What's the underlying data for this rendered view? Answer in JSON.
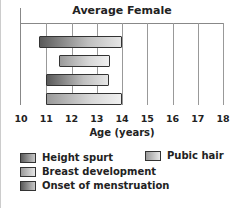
{
  "chart_data": {
    "type": "bar",
    "orientation": "horizontal-range",
    "title": "Average Female",
    "xlabel": "Age (years)",
    "ylabel": "",
    "xlim": [
      10,
      18
    ],
    "x_ticks": [
      "10",
      "11",
      "12",
      "13",
      "14",
      "15",
      "16",
      "17",
      "18"
    ],
    "grid": true,
    "legend_position": "bottom",
    "series": [
      {
        "name": "Height spurt",
        "start": 10.7,
        "end": 14.0,
        "style": "dark"
      },
      {
        "name": "Pubic hair",
        "start": 11.5,
        "end": 13.5,
        "style": "light"
      },
      {
        "name": "Breast development",
        "start": 11.0,
        "end": 13.5,
        "style": "dark"
      },
      {
        "name": "Onset of menstruation",
        "start": 11.0,
        "end": 14.0,
        "style": "light"
      }
    ]
  },
  "legend": [
    {
      "label": "Height spurt"
    },
    {
      "label": "Pubic hair"
    },
    {
      "label": "Breast development"
    },
    {
      "label": "Onset of menstruation"
    }
  ]
}
